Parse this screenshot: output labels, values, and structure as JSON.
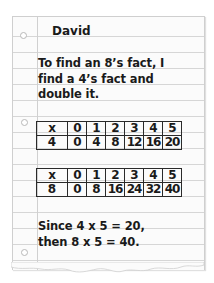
{
  "note": {
    "name": "David",
    "intro_line1": "To find an 8’s fact, I",
    "intro_line2": "find a 4’s fact and",
    "intro_line3": "double it.",
    "table1": {
      "header": [
        "x",
        "0",
        "1",
        "2",
        "3",
        "4",
        "5"
      ],
      "row": [
        "4",
        "0",
        "4",
        "8",
        "12",
        "16",
        "20"
      ]
    },
    "table2": {
      "header": [
        "x",
        "0",
        "1",
        "2",
        "3",
        "4",
        "5"
      ],
      "row": [
        "8",
        "0",
        "8",
        "16",
        "24",
        "32",
        "40"
      ]
    },
    "conclusion_line1": "Since 4 x 5 = 20,",
    "conclusion_line2": "then 8 x 5 = 40."
  },
  "colors": {
    "paper": "#fbfbfb",
    "rule_lines": "#d6d6d6",
    "ink": "#1a1a1a"
  }
}
